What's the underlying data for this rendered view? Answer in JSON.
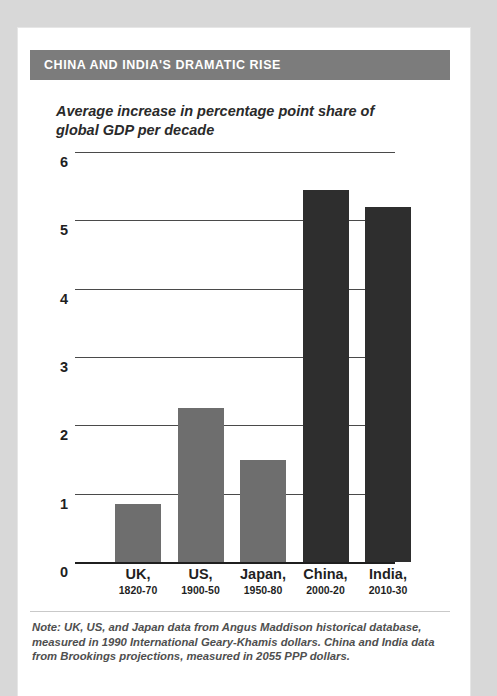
{
  "header": {
    "title": "CHINA AND INDIA'S DRAMATIC RISE",
    "banner_color": "#7c7c7c",
    "title_color": "#ffffff"
  },
  "footnote": {
    "text": "Note: UK, US, and Japan data from Angus Maddison historical database, measured in 1990 International Geary-Khamis dollars. China and India data from Brookings projections, measured in 2055 PPP dollars."
  },
  "chart_data": {
    "type": "bar",
    "title": "CHINA AND INDIA'S DRAMATIC RISE",
    "subtitle": "Average increase in percentage point share of global GDP per decade",
    "xlabel": "",
    "ylabel": "",
    "ylim": [
      0,
      6
    ],
    "yticks": [
      0,
      1,
      2,
      3,
      4,
      5,
      6
    ],
    "ytick_labels": [
      "0",
      "1",
      "2",
      "3",
      "4",
      "5",
      "6"
    ],
    "grid": true,
    "legend": "none",
    "categories": [
      "UK,",
      "US,",
      "Japan,",
      "China,",
      "India,"
    ],
    "category_names": [
      "UK",
      "US",
      "Japan",
      "China",
      "India"
    ],
    "periods": [
      "1820-70",
      "1900-50",
      "1950-80",
      "2000-20",
      "2010-30"
    ],
    "values": [
      0.85,
      2.25,
      1.5,
      5.45,
      5.2
    ],
    "colors": [
      "#6e6e6e",
      "#6e6e6e",
      "#6e6e6e",
      "#2e2e2e",
      "#2e2e2e"
    ],
    "bars": [
      {
        "name": "UK",
        "period": "1820-70",
        "value": 0.85,
        "color": "#6e6e6e"
      },
      {
        "name": "US",
        "period": "1900-50",
        "value": 2.25,
        "color": "#6e6e6e"
      },
      {
        "name": "Japan",
        "period": "1950-80",
        "value": 1.5,
        "color": "#6e6e6e"
      },
      {
        "name": "China",
        "period": "2000-20",
        "value": 5.45,
        "color": "#2e2e2e"
      },
      {
        "name": "India",
        "period": "2010-30",
        "value": 5.2,
        "color": "#2e2e2e"
      }
    ]
  }
}
